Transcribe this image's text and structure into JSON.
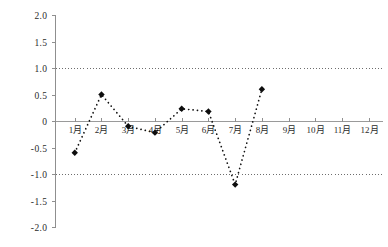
{
  "chart_data": {
    "type": "line",
    "title": "",
    "subtitle": "",
    "xlabel": "",
    "ylabel": "",
    "categories": [
      "1月",
      "2月",
      "3月",
      "4月",
      "5月",
      "6月",
      "7月",
      "8月",
      "9月",
      "10月",
      "11月",
      "12月"
    ],
    "values": [
      -0.6,
      0.5,
      -0.1,
      -0.22,
      0.23,
      0.18,
      -1.2,
      0.6,
      null,
      null,
      null,
      null
    ],
    "series": [
      {
        "name": "",
        "values": [
          -0.6,
          0.5,
          -0.1,
          -0.22,
          0.23,
          0.18,
          -1.2,
          0.6,
          null,
          null,
          null,
          null
        ]
      }
    ],
    "ylim": [
      -2.0,
      2.0
    ],
    "y_ticks": [
      2.0,
      1.5,
      1.0,
      0.5,
      0,
      -0.5,
      -1.0,
      -1.5,
      -2.0
    ],
    "y_tick_labels": [
      "2.0",
      "1.5",
      "1.0",
      "0.5",
      "0",
      "-0.5",
      "-1.0",
      "-1.5",
      "-2.0"
    ],
    "x_tick_labels": [
      "1月",
      "2月",
      "3月",
      "4月",
      "5月",
      "6月",
      "7月",
      "8月",
      "9月",
      "10月",
      "11月",
      "12月"
    ],
    "grid": false,
    "legend": null,
    "legend_position": "none",
    "annotations": [],
    "reference_lines": [
      {
        "value": 1.0,
        "style": "dotted",
        "label": ""
      },
      {
        "value": -1.0,
        "style": "dotted",
        "label": ""
      }
    ],
    "zero_line": 0,
    "marker": "diamond",
    "line_style": "dotted",
    "colors": {
      "series": "#0d0d0d",
      "axis": "#8f8f8f",
      "reference_line": "#6d6d6d",
      "text": "#2b2b2b",
      "background": "#ffffff"
    }
  }
}
